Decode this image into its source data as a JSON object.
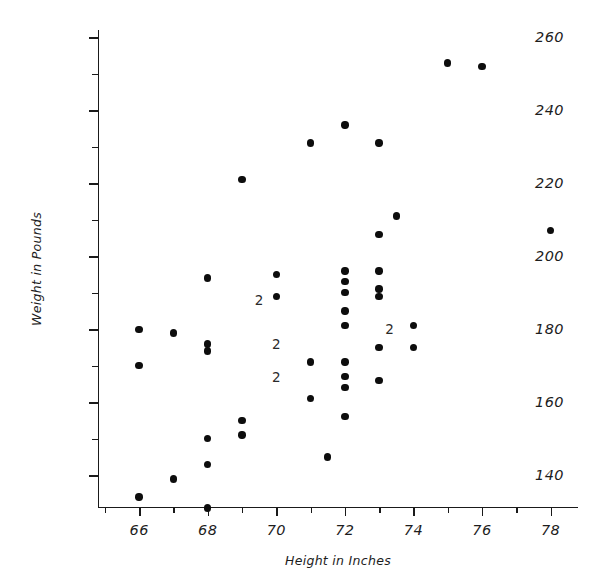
{
  "chart_data": {
    "type": "scatter",
    "title": "",
    "xlabel": "Height in Inches",
    "ylabel": "Weight in Pounds",
    "xlim": [
      64.8,
      78.8
    ],
    "ylim": [
      131,
      262
    ],
    "grid": false,
    "legend": "none",
    "marker": "filled-circle",
    "marker_color": "#0d0d0d",
    "x_major_ticks": [
      66,
      68,
      70,
      72,
      74,
      76,
      78
    ],
    "x_minor_ticks": [
      65,
      67,
      69,
      71,
      73,
      75,
      77,
      79
    ],
    "y_major_ticks": [
      140,
      160,
      180,
      200,
      220,
      240,
      260
    ],
    "y_minor_ticks": [
      150,
      170,
      190,
      210,
      230,
      250
    ],
    "x_tick_labels": [
      "66",
      "68",
      "70",
      "72",
      "74",
      "76",
      "78"
    ],
    "y_tick_labels": [
      "140",
      "160",
      "180",
      "200",
      "220",
      "240",
      "260"
    ],
    "overlap_notation": "Numeric label '2' marks a location where two observations coincide",
    "points": [
      {
        "x": 66,
        "y": 180,
        "n": 1
      },
      {
        "x": 66,
        "y": 170,
        "n": 1
      },
      {
        "x": 66,
        "y": 134,
        "n": 1
      },
      {
        "x": 67,
        "y": 179,
        "n": 1
      },
      {
        "x": 67,
        "y": 139,
        "n": 1
      },
      {
        "x": 68,
        "y": 194,
        "n": 1
      },
      {
        "x": 68,
        "y": 176,
        "n": 1
      },
      {
        "x": 68,
        "y": 174,
        "n": 1
      },
      {
        "x": 68,
        "y": 150,
        "n": 1
      },
      {
        "x": 68,
        "y": 143,
        "n": 1
      },
      {
        "x": 68,
        "y": 131,
        "n": 1
      },
      {
        "x": 69,
        "y": 221,
        "n": 1
      },
      {
        "x": 69,
        "y": 155,
        "n": 1
      },
      {
        "x": 69,
        "y": 151,
        "n": 1
      },
      {
        "x": 70,
        "y": 195,
        "n": 1
      },
      {
        "x": 70,
        "y": 189,
        "n": 1
      },
      {
        "x": 70,
        "y": 176,
        "n": 2
      },
      {
        "x": 70,
        "y": 167,
        "n": 2
      },
      {
        "x": 69.5,
        "y": 188,
        "n": 2
      },
      {
        "x": 71,
        "y": 231,
        "n": 1
      },
      {
        "x": 71,
        "y": 171,
        "n": 1
      },
      {
        "x": 71,
        "y": 161,
        "n": 1
      },
      {
        "x": 71.5,
        "y": 145,
        "n": 1
      },
      {
        "x": 72,
        "y": 236,
        "n": 1
      },
      {
        "x": 72,
        "y": 196,
        "n": 1
      },
      {
        "x": 72,
        "y": 193,
        "n": 1
      },
      {
        "x": 72,
        "y": 190,
        "n": 1
      },
      {
        "x": 72,
        "y": 185,
        "n": 1
      },
      {
        "x": 72,
        "y": 181,
        "n": 1
      },
      {
        "x": 72,
        "y": 171,
        "n": 1
      },
      {
        "x": 72,
        "y": 167,
        "n": 1
      },
      {
        "x": 72,
        "y": 164,
        "n": 1
      },
      {
        "x": 72,
        "y": 156,
        "n": 1
      },
      {
        "x": 73,
        "y": 231,
        "n": 1
      },
      {
        "x": 73,
        "y": 206,
        "n": 1
      },
      {
        "x": 73,
        "y": 196,
        "n": 1
      },
      {
        "x": 73,
        "y": 191,
        "n": 1
      },
      {
        "x": 73,
        "y": 189,
        "n": 1
      },
      {
        "x": 73,
        "y": 175,
        "n": 1
      },
      {
        "x": 73,
        "y": 166,
        "n": 1
      },
      {
        "x": 73.3,
        "y": 180,
        "n": 2
      },
      {
        "x": 73.5,
        "y": 211,
        "n": 1
      },
      {
        "x": 74,
        "y": 181,
        "n": 1
      },
      {
        "x": 74,
        "y": 175,
        "n": 1
      },
      {
        "x": 75,
        "y": 253,
        "n": 1
      },
      {
        "x": 76,
        "y": 252,
        "n": 1
      },
      {
        "x": 78,
        "y": 207,
        "n": 1
      }
    ]
  },
  "axes": {
    "x_title": "Height in Inches",
    "y_title": "Weight in Pounds"
  }
}
